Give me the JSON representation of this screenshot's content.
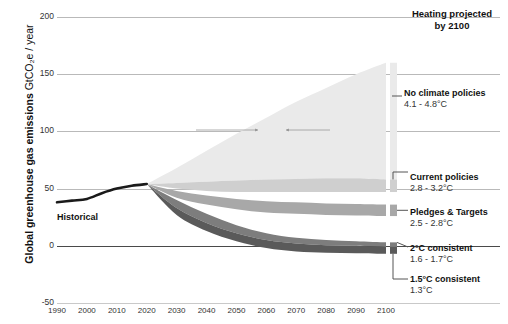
{
  "chart_data": {
    "type": "area",
    "title": "",
    "xlabel": "",
    "ylabel": "Global greenhouse gas emissions GtCO2e / year",
    "ylabel_strong": "Global greenhouse gas emissions",
    "ylabel_light": "GtCO₂e / year",
    "xlim": [
      1990,
      2100
    ],
    "ylim": [
      -50,
      200
    ],
    "yticks": [
      "200",
      "150",
      "100",
      "50",
      "0",
      "-50"
    ],
    "ytick_values": [
      200,
      150,
      100,
      50,
      0,
      -50
    ],
    "xticks": [
      "1990",
      "2000",
      "2010",
      "2020",
      "2030",
      "2040",
      "2050",
      "2060",
      "2070",
      "2080",
      "2090",
      "2100"
    ],
    "xtick_values": [
      1990,
      2000,
      2010,
      2020,
      2030,
      2040,
      2050,
      2060,
      2070,
      2080,
      2090,
      2100
    ],
    "grid": true,
    "legend_position": "right",
    "historical": {
      "name": "Historical",
      "x": [
        1990,
        1995,
        2000,
        2005,
        2010,
        2015,
        2020
      ],
      "values": [
        38,
        39.5,
        41,
        46,
        50,
        52.5,
        54
      ]
    },
    "series": [
      {
        "name": "No climate policies",
        "temperature": "4.1 - 4.8°C",
        "color": "#eaeaea",
        "x": [
          2020,
          2030,
          2040,
          2050,
          2060,
          2070,
          2080,
          2090,
          2100
        ],
        "upper": [
          54,
          68,
          83,
          98,
          112,
          126,
          138,
          150,
          160
        ],
        "lower": [
          54,
          55,
          56,
          57,
          58,
          58.5,
          59,
          59,
          58
        ]
      },
      {
        "name": "Current policies",
        "temperature": "2.8 - 3.2°C",
        "color": "#cfcfcf",
        "x": [
          2020,
          2030,
          2040,
          2050,
          2060,
          2070,
          2080,
          2090,
          2100
        ],
        "upper": [
          54,
          55,
          56,
          57,
          58,
          58.5,
          59,
          59,
          58
        ],
        "lower": [
          54,
          50,
          48,
          47,
          47,
          47,
          47,
          47,
          47
        ]
      },
      {
        "name": "Pledges & Targets",
        "temperature": "2.5 - 2.8°C",
        "color": "#a8a8a8",
        "x": [
          2020,
          2030,
          2040,
          2050,
          2060,
          2070,
          2080,
          2090,
          2100
        ],
        "upper": [
          54,
          48,
          44,
          41,
          39,
          38,
          37,
          36.5,
          36
        ],
        "lower": [
          54,
          42,
          36,
          32,
          29,
          28,
          27,
          26.5,
          26
        ]
      },
      {
        "name": "2°C consistent",
        "temperature": "1.6 - 1.7°C",
        "color": "#7d7d7d",
        "x": [
          2020,
          2030,
          2040,
          2050,
          2060,
          2070,
          2080,
          2090,
          2100
        ],
        "upper": [
          54,
          40,
          28,
          18,
          11,
          7,
          5,
          4,
          3
        ],
        "lower": [
          54,
          33,
          20,
          11,
          5,
          2,
          0.5,
          0,
          -1
        ]
      },
      {
        "name": "1.5°C consistent",
        "temperature": "1.3°C",
        "color": "#5a5a5a",
        "x": [
          2020,
          2030,
          2040,
          2050,
          2060,
          2070,
          2080,
          2090,
          2100
        ],
        "upper": [
          54,
          33,
          20,
          11,
          5,
          2,
          0.5,
          0,
          -1
        ],
        "lower": [
          54,
          27,
          13,
          4,
          -2,
          -5,
          -6,
          -6.5,
          -7
        ]
      }
    ]
  },
  "annotations": {
    "heading_projected_line1": "Heating projected",
    "heading_projected_line2": "by 2100",
    "historical_label": "Historical"
  },
  "labels": {
    "no_climate_policies": {
      "name": "No climate policies",
      "temp": "4.1 - 4.8°C"
    },
    "current_policies": {
      "name": "Current policies",
      "temp": "2.8 - 3.2°C"
    },
    "pledges_targets": {
      "name": "Pledges & Targets",
      "temp": "2.5 - 2.8°C"
    },
    "two_c_consistent": {
      "name": "2°C consistent",
      "temp": "1.6 - 1.7°C"
    },
    "one_five_c_consistent": {
      "name": "1.5°C consistent",
      "temp": "1.3°C"
    }
  },
  "colors": {
    "no_climate_policies": "#eaeaea",
    "current_policies": "#cfcfcf",
    "pledges_targets": "#a8a8a8",
    "two_c": "#7d7d7d",
    "one_five_c": "#5a5a5a",
    "historical_line": "#1a1a1a",
    "gridline": "#b9b9b9",
    "zero_line": "#4a4a4a"
  }
}
